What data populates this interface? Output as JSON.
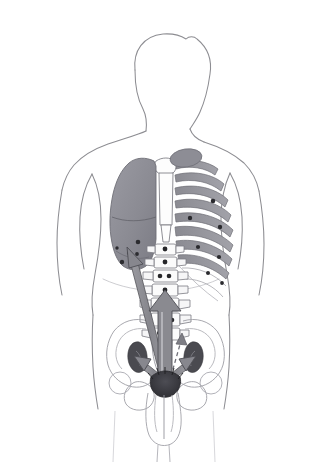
{
  "figure": {
    "title": "Prostate cancer metastatic spread diagram",
    "view": "posterior male torso, anatomical illustration",
    "style": "pencil line drawing with grey wash shading",
    "border_color": "#8e8e8e",
    "background_color": "#ffffff"
  },
  "palette": {
    "outline": "#8d8d92",
    "outline_faint": "#b4b4ba",
    "bone_fill": "#ffffff",
    "bone_shade": "#9a9a9e",
    "rib_shade": "#8f8f95",
    "organ_lung": "#8e8e96",
    "organ_lung_dark": "#77777f",
    "lesion": "#2c2c30",
    "lymph_node": "#4a4a50",
    "prostate": "#3a3a40",
    "arrow_fill": "#8a8a90",
    "arrow_stroke": "#55555b",
    "arrow_light": "#e9e9ec"
  },
  "body": {
    "name": "male-torso-outline",
    "parts": [
      {
        "id": "head",
        "label": "Head"
      },
      {
        "id": "neck",
        "label": "Neck"
      },
      {
        "id": "shoulder-left",
        "label": "Left shoulder"
      },
      {
        "id": "shoulder-right",
        "label": "Right shoulder"
      },
      {
        "id": "arm-left",
        "label": "Left arm"
      },
      {
        "id": "arm-right",
        "label": "Right arm"
      },
      {
        "id": "torso",
        "label": "Torso"
      },
      {
        "id": "hips",
        "label": "Hips"
      }
    ]
  },
  "skeleton": {
    "sternum": {
      "label": "Sternum",
      "visible": true
    },
    "clavicle": {
      "label": "Clavicle",
      "visible": true
    },
    "ribs": {
      "label": "Rib cage",
      "side": "right of image",
      "rib_count": 10
    },
    "thoracic_spine": {
      "label": "Thoracic spine",
      "vertebra_count": 4
    },
    "lumbar_spine": {
      "label": "Lumbar spine",
      "vertebra_count": 5
    },
    "sacrum": {
      "label": "Sacrum",
      "visible": true
    },
    "pelvis": {
      "label": "Pelvic girdle",
      "visible": true
    },
    "femur_heads": {
      "label": "Femoral heads",
      "visible": true
    }
  },
  "organs": {
    "lung": {
      "label": "Lung",
      "side": "left of image",
      "shading": "grey wash",
      "lesion_count": 6
    },
    "prostate": {
      "label": "Prostate (primary tumour)",
      "shading": "dark grey",
      "is_primary_site": true
    },
    "urethra": {
      "label": "Urethra",
      "visible": true
    },
    "penis": {
      "label": "Penis outline",
      "visible": true
    },
    "lymph_nodes": {
      "label": "Pelvic lymph nodes",
      "count": 2,
      "sides": [
        "left",
        "right"
      ]
    }
  },
  "lesions": {
    "label": "Metastatic deposits",
    "marker": "dark filled spot",
    "locations": [
      {
        "site": "lung",
        "count": 6
      },
      {
        "site": "ribs",
        "count": 7
      },
      {
        "site": "thoracic vertebrae",
        "count": 4
      },
      {
        "site": "lumbar vertebrae",
        "count": 6
      },
      {
        "site": "pelvis",
        "count": 2
      }
    ],
    "total_marked": 25
  },
  "arrows": {
    "label": "Routes of metastatic spread from prostate",
    "origin": "prostate",
    "items": [
      {
        "id": "arrow-to-lung",
        "label": "Haematogenous spread to lung",
        "from": "prostate",
        "to": "lung",
        "direction": "up-left",
        "style": "long solid arrow"
      },
      {
        "id": "arrow-to-spine",
        "label": "Spread to vertebral column",
        "from": "prostate",
        "to": "lumbar spine",
        "direction": "up",
        "style": "wide open arrow"
      },
      {
        "id": "arrow-to-lymph-left",
        "label": "Lymphatic spread to left pelvic nodes",
        "from": "prostate",
        "to": "left lymph node",
        "direction": "up-left",
        "style": "short solid arrow"
      },
      {
        "id": "arrow-to-lymph-right",
        "label": "Lymphatic spread to right pelvic nodes",
        "from": "prostate",
        "to": "right lymph node",
        "direction": "up-right",
        "style": "short solid arrow"
      },
      {
        "id": "arrow-to-pelvis",
        "label": "Local spread to pelvic bone",
        "from": "prostate",
        "to": "pelvis",
        "direction": "up",
        "style": "dashed arrow"
      }
    ]
  }
}
